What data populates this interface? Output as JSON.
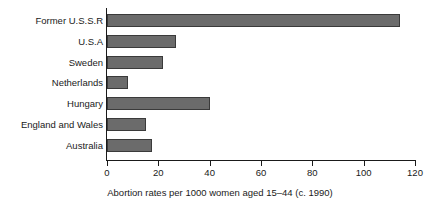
{
  "chart_data": {
    "type": "bar",
    "orientation": "horizontal",
    "title": "",
    "xlabel": "Abortion rates per 1000 women aged 15–44 (c. 1990)",
    "ylabel": "",
    "categories": [
      "Former U.S.S.R",
      "U.S.A",
      "Sweden",
      "Netherlands",
      "Hungary",
      "England and Wales",
      "Australia"
    ],
    "values": [
      114,
      27,
      22,
      8,
      40,
      15,
      17.5
    ],
    "xlim": [
      0,
      120
    ],
    "xticks": [
      0,
      20,
      40,
      60,
      80,
      100,
      120
    ],
    "xtick_labels": [
      "0",
      "20",
      "40",
      "60",
      "80",
      "100",
      "120"
    ],
    "grid": false,
    "legend": false,
    "bar_color": "#6b6b6b",
    "bar_edge_color": "#3a3a3a",
    "axis_color": "#1a1a1a",
    "background_color": "#ffffff"
  }
}
